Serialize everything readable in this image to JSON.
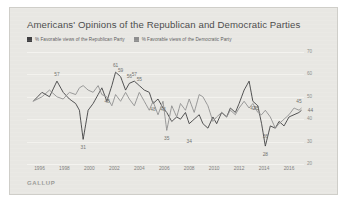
{
  "title": "Americans' Opinions of the Republican and Democratic Parties",
  "source": "GALLUP",
  "colors": {
    "republican": "#3f3f41",
    "democratic": "#8e8e8e",
    "background": "#e8e7e3",
    "border": "#cfcec9",
    "text": "#4b4b4b",
    "axis_text": "#7c7c79",
    "gridline": "#f4f3f0"
  },
  "legend": {
    "position": "top-left",
    "items": [
      {
        "label": "% Favorable views of the Republican Party",
        "color": "#3f3f41",
        "icon": "square-swatch"
      },
      {
        "label": "% Favorable views of the Democratic Party",
        "color": "#8e8e8e",
        "icon": "square-swatch"
      }
    ]
  },
  "chart_data": {
    "type": "line",
    "title": "Americans' Opinions of the Republican and Democratic Parties",
    "subtitle": "",
    "xlabel": "",
    "ylabel": "",
    "xlim": [
      1995.0,
      2017.2
    ],
    "ylim": [
      20,
      70
    ],
    "grid": true,
    "legend_position": "top-left",
    "yticks": [
      70,
      60,
      50,
      40,
      30,
      20
    ],
    "ytick_labels": [
      "70",
      "60",
      "50",
      "40",
      "30",
      "20"
    ],
    "xticks": [
      1996,
      1998,
      2000,
      2002,
      2004,
      2006,
      2008,
      2010,
      2012,
      2014,
      2016
    ],
    "xtick_labels": [
      "1996",
      "1998",
      "2000",
      "2002",
      "2004",
      "2006",
      "2008",
      "2010",
      "2012",
      "2014",
      "2016"
    ],
    "series": [
      {
        "name": "% Favorable views of the Republican Party",
        "color": "#3f3f41",
        "x": [
          1995.5,
          1996.2,
          1996.8,
          1997.4,
          1997.9,
          1998.4,
          1998.9,
          1999.2,
          1999.5,
          1999.9,
          2000.3,
          2000.7,
          2001.0,
          2001.4,
          2001.8,
          2002.1,
          2002.5,
          2002.9,
          2003.2,
          2003.6,
          2004.0,
          2004.4,
          2004.8,
          2005.1,
          2005.5,
          2005.9,
          2006.2,
          2006.6,
          2007.0,
          2007.3,
          2007.7,
          2008.0,
          2008.4,
          2008.8,
          2009.1,
          2009.5,
          2009.9,
          2010.2,
          2010.6,
          2011.0,
          2011.3,
          2011.7,
          2012.0,
          2012.4,
          2012.8,
          2013.1,
          2013.5,
          2013.8,
          2014.1,
          2014.5,
          2014.9,
          2015.2,
          2015.6,
          2016.0,
          2016.4,
          2016.8,
          2017.0
        ],
        "y": [
          48,
          52,
          50,
          57,
          52,
          49,
          47,
          44,
          31,
          44,
          47,
          51,
          54,
          48,
          55,
          61,
          59,
          53,
          56,
          57,
          55,
          53,
          52,
          47,
          49,
          45,
          43,
          39,
          41,
          40,
          43,
          38,
          40,
          42,
          38,
          36,
          41,
          38,
          43,
          41,
          45,
          43,
          47,
          53,
          57,
          48,
          46,
          38,
          28,
          37,
          36,
          39,
          37,
          41,
          42,
          43,
          44
        ]
      },
      {
        "name": "% Favorable views of the Democratic Party",
        "color": "#8e8e8e",
        "x": [
          1995.5,
          1996.2,
          1996.8,
          1997.4,
          1997.9,
          1998.4,
          1998.9,
          1999.2,
          1999.5,
          1999.9,
          2000.3,
          2000.7,
          2001.0,
          2001.4,
          2001.8,
          2002.1,
          2002.5,
          2002.9,
          2003.2,
          2003.6,
          2004.0,
          2004.4,
          2004.8,
          2005.1,
          2005.5,
          2005.9,
          2006.2,
          2006.6,
          2007.0,
          2007.3,
          2007.7,
          2008.0,
          2008.4,
          2008.8,
          2009.1,
          2009.5,
          2009.9,
          2010.2,
          2010.6,
          2011.0,
          2011.3,
          2011.7,
          2012.0,
          2012.4,
          2012.8,
          2013.1,
          2013.5,
          2013.8,
          2014.1,
          2014.5,
          2014.9,
          2015.2,
          2015.6,
          2016.0,
          2016.4,
          2016.8,
          2017.0
        ],
        "y": [
          48,
          50,
          53,
          50,
          49,
          52,
          51,
          54,
          55,
          53,
          52,
          55,
          51,
          50,
          46,
          51,
          48,
          52,
          49,
          46,
          52,
          48,
          44,
          48,
          42,
          48,
          35,
          46,
          41,
          47,
          44,
          49,
          43,
          51,
          50,
          46,
          39,
          41,
          43,
          41,
          44,
          42,
          45,
          48,
          45,
          47,
          43,
          42,
          44,
          41,
          36,
          38,
          40,
          42,
          45,
          44,
          45
        ]
      }
    ],
    "point_labels": [
      {
        "text": "57",
        "x": 1997.4,
        "y": 57,
        "series": "republican",
        "position": "above"
      },
      {
        "text": "31",
        "x": 1999.5,
        "y": 31,
        "series": "republican",
        "position": "below"
      },
      {
        "text": "61",
        "x": 2002.1,
        "y": 61,
        "series": "republican",
        "position": "above"
      },
      {
        "text": "59",
        "x": 2002.5,
        "y": 59,
        "series": "republican",
        "position": "above"
      },
      {
        "text": "56",
        "x": 2003.2,
        "y": 56,
        "series": "republican",
        "position": "above"
      },
      {
        "text": "57",
        "x": 2003.6,
        "y": 57,
        "series": "republican",
        "position": "above"
      },
      {
        "text": "55",
        "x": 2004.0,
        "y": 55,
        "series": "republican",
        "position": "above"
      },
      {
        "text": "48",
        "x": 2000.7,
        "y": 48,
        "series": "democratic",
        "position": "right"
      },
      {
        "text": "48",
        "x": 2005.1,
        "y": 48,
        "series": "democratic",
        "position": "below"
      },
      {
        "text": "48",
        "x": 2005.9,
        "y": 48,
        "series": "democratic",
        "position": "below"
      },
      {
        "text": "35",
        "x": 2006.2,
        "y": 35,
        "series": "democratic",
        "position": "below"
      },
      {
        "text": "34",
        "x": 2008.0,
        "y": 34,
        "series": "republican",
        "position": "below"
      },
      {
        "text": "42",
        "x": 2013.1,
        "y": 42,
        "series": "republican",
        "position": "above"
      },
      {
        "text": "45",
        "x": 2014.1,
        "y": 45,
        "series": "democratic",
        "position": "left"
      },
      {
        "text": "36",
        "x": 2014.1,
        "y": 36,
        "series": "democratic",
        "position": "below"
      },
      {
        "text": "28",
        "x": 2014.1,
        "y": 28,
        "series": "republican",
        "position": "below"
      },
      {
        "text": "45",
        "x": 2016.8,
        "y": 45,
        "series": "democratic",
        "position": "above"
      },
      {
        "text": "44",
        "x": 2017.0,
        "y": 44,
        "series": "republican",
        "position": "right"
      }
    ]
  }
}
